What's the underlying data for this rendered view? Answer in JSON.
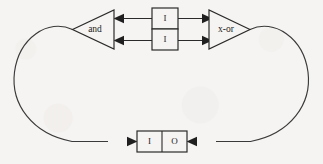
{
  "diagram": {
    "type": "logic-circuit-feedback-loop",
    "background_color": "#f6f4f2",
    "line_color": "#2a2a2a",
    "nodes": {
      "and_gate": {
        "label": "and",
        "shape": "triangle",
        "direction": "left"
      },
      "xor_gate": {
        "label": "x-or",
        "shape": "triangle",
        "direction": "right"
      },
      "top_box_upper": {
        "label": "I",
        "shape": "rectangle"
      },
      "top_box_lower": {
        "label": "I",
        "shape": "rectangle"
      },
      "bottom_box_left_cell": {
        "label": "I",
        "shape": "rectangle"
      },
      "bottom_box_right_cell": {
        "label": "O",
        "shape": "rectangle"
      }
    },
    "edges": [
      {
        "name": "upper-box-to-and",
        "direction": "left",
        "arrow": "left-arrowhead"
      },
      {
        "name": "lower-box-to-and",
        "direction": "left",
        "arrow": "left-arrowhead"
      },
      {
        "name": "upper-box-to-xor",
        "direction": "right",
        "arrow": "right-arrowhead"
      },
      {
        "name": "lower-box-to-xor",
        "direction": "right",
        "arrow": "right-arrowhead"
      },
      {
        "name": "and-loop-to-io-box",
        "direction": "right",
        "arrow": "right-arrowhead"
      },
      {
        "name": "xor-loop-to-io-box",
        "direction": "left",
        "arrow": "left-arrowhead"
      }
    ]
  }
}
